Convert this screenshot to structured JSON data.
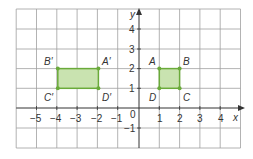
{
  "diagram": {
    "type": "coordinate-grid-translation",
    "x_axis_label": "x",
    "y_axis_label": "y",
    "origin_label": "0",
    "x_range": [
      -6,
      5
    ],
    "y_range": [
      -2,
      5
    ],
    "x_tick_labels": [
      {
        "v": -5,
        "t": "−5"
      },
      {
        "v": -4,
        "t": "−4"
      },
      {
        "v": -3,
        "t": "−3"
      },
      {
        "v": -2,
        "t": "−2"
      },
      {
        "v": -1,
        "t": "−1"
      },
      {
        "v": 1,
        "t": "1"
      },
      {
        "v": 2,
        "t": "2"
      },
      {
        "v": 3,
        "t": "3"
      },
      {
        "v": 4,
        "t": "4"
      }
    ],
    "y_tick_labels": [
      {
        "v": 4,
        "t": "4"
      },
      {
        "v": 3,
        "t": "3"
      },
      {
        "v": 2,
        "t": "2"
      },
      {
        "v": 1,
        "t": "1"
      },
      {
        "v": -1,
        "t": "−1"
      }
    ],
    "colors": {
      "grid": "#9a9a9a",
      "axis": "#333333",
      "shape_fill": "#c9e3b0",
      "shape_stroke": "#6aaa3a",
      "point": "#6aaa3a"
    },
    "shapes": [
      {
        "name": "ABCD",
        "points": [
          {
            "label": "A",
            "x": 1,
            "y": 2
          },
          {
            "label": "B",
            "x": 2,
            "y": 2
          },
          {
            "label": "C",
            "x": 2,
            "y": 1
          },
          {
            "label": "D",
            "x": 1,
            "y": 1
          }
        ]
      },
      {
        "name": "A'B'C'D'",
        "points": [
          {
            "label": "A′",
            "x": -2,
            "y": 2
          },
          {
            "label": "B′",
            "x": -4,
            "y": 2
          },
          {
            "label": "C′",
            "x": -4,
            "y": 1
          },
          {
            "label": "D′",
            "x": -2,
            "y": 1
          }
        ]
      }
    ]
  },
  "labels": {
    "A": "A",
    "B": "B",
    "C": "C",
    "D": "D",
    "A_prime": "A′",
    "B_prime": "B′",
    "C_prime": "C′",
    "D_prime": "D′",
    "x": "x",
    "y": "y",
    "origin": "0",
    "xt_m5": "−5",
    "xt_m4": "−4",
    "xt_m3": "−3",
    "xt_m2": "−2",
    "xt_m1": "−1",
    "xt_1": "1",
    "xt_2": "2",
    "xt_3": "3",
    "xt_4": "4",
    "yt_4": "4",
    "yt_3": "3",
    "yt_2": "2",
    "yt_1": "1",
    "yt_m1": "−1"
  }
}
